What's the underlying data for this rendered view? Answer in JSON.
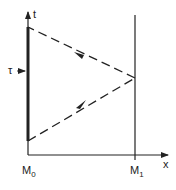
{
  "diagram": {
    "axis_x_label": "x",
    "axis_t_label": "t",
    "tau_label": "τ",
    "m0": {
      "base": "M",
      "sub": "0"
    },
    "m1": {
      "base": "M",
      "sub": "1"
    },
    "colors": {
      "line": "#222222",
      "background": "#ffffff"
    }
  }
}
